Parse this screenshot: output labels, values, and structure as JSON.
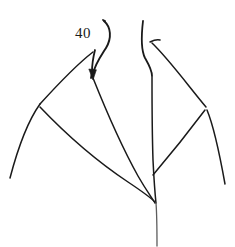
{
  "figure": {
    "domain": "diagram",
    "kind": "patent-line-drawing",
    "background_color": "#ffffff",
    "ink_color": "#1a1a1a",
    "faded_ink_color": "#5d5d5d",
    "canvas": {
      "width": 235,
      "height": 247
    },
    "reference_labels": [
      {
        "id": "40",
        "text": "40",
        "x": 75,
        "y": 26,
        "font_size_px": 15,
        "leader": {
          "has_arrowhead": true,
          "arrow_tip": {
            "x": 93,
            "y": 80
          },
          "path": "M 104 21 C 111 27 112 38 106 48 C 101 56 95 64 93 74"
        }
      }
    ],
    "strokes": [
      {
        "name": "leader-curve-40",
        "weight": "lead",
        "path": "M 104 21 C 111 27 112 38 106 48 C 101 56 95 64 93 74"
      },
      {
        "name": "leader-dot-40",
        "weight": "lead",
        "path": "M 103 20 L 105 21"
      },
      {
        "name": "left-collar-outer-edge",
        "weight": "med",
        "path": "M 95 50 C 93 58 92 66 92 72 L 91 78"
      },
      {
        "name": "left-collar-upper-diagonal",
        "weight": "thin",
        "path": "M 93 52 C 80 62 60 82 40 104"
      },
      {
        "name": "left-shoulder-seam",
        "weight": "thin",
        "path": "M 40 104 C 30 118 20 140 10 178"
      },
      {
        "name": "left-collar-lower-edge",
        "weight": "thin",
        "path": "M 40 107 C 60 128 92 158 128 182 C 140 190 150 197 155 202"
      },
      {
        "name": "left-lapel-fold",
        "weight": "thin",
        "path": "M 93 78 C 101 98 118 140 138 176 C 146 190 152 198 155 203"
      },
      {
        "name": "neck-left-edge",
        "weight": "med",
        "path": "M 143 21 C 141 38 141 50 145 58 C 149 65 152 70 152 76"
      },
      {
        "name": "neck-right-inner",
        "weight": "thin",
        "path": "M 150 42 C 154 40 157 39 160 40"
      },
      {
        "name": "right-collar-upper-diagonal",
        "weight": "thin",
        "path": "M 152 43 C 168 58 190 88 206 107"
      },
      {
        "name": "right-shoulder-seam",
        "weight": "thin",
        "path": "M 207 110 C 212 122 218 145 225 184"
      },
      {
        "name": "right-collar-lower-edge",
        "weight": "thin",
        "path": "M 205 110 C 190 130 170 155 153 175"
      },
      {
        "name": "right-lapel-fold",
        "weight": "thin",
        "path": "M 152 77 C 152 100 152 130 153 160 C 154 180 155 194 156 203"
      },
      {
        "name": "center-front-line",
        "weight": "fade",
        "path": "M 156 203 C 157 216 157 232 157 246"
      }
    ]
  }
}
